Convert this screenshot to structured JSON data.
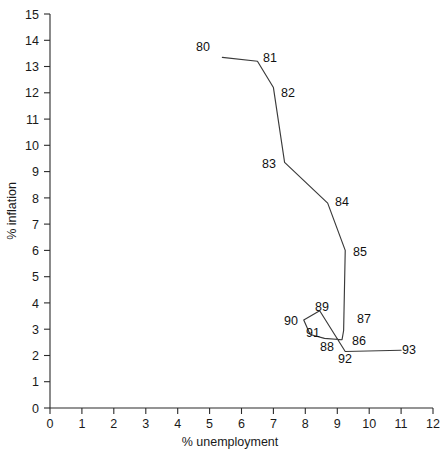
{
  "chart_data": {
    "type": "line",
    "title": "",
    "subtitle": "",
    "xlabel": "% unemployment",
    "ylabel": "% inflation",
    "xlim": [
      0,
      12
    ],
    "ylim": [
      0,
      15
    ],
    "xticks": [
      0,
      1,
      2,
      3,
      4,
      5,
      6,
      7,
      8,
      9,
      10,
      11,
      12
    ],
    "yticks": [
      0,
      1,
      2,
      3,
      4,
      5,
      6,
      7,
      8,
      9,
      10,
      11,
      12,
      13,
      14,
      15
    ],
    "grid": false,
    "legend": null,
    "legend_position": "none",
    "series": [
      {
        "name": "Phillips curve path",
        "point_labels": [
          "80",
          "81",
          "82",
          "83",
          "84",
          "85",
          "87",
          "86",
          "88",
          "91",
          "90",
          "89",
          "92",
          "93"
        ],
        "x": [
          5.4,
          6.5,
          7.0,
          7.35,
          8.7,
          9.25,
          9.2,
          9.15,
          8.6,
          8.15,
          7.95,
          8.45,
          9.25,
          11.0
        ],
        "y": [
          13.35,
          13.2,
          12.2,
          9.35,
          7.8,
          6.0,
          2.95,
          2.6,
          2.65,
          2.8,
          3.35,
          3.7,
          2.15,
          2.2
        ]
      }
    ],
    "annotations": [
      {
        "label": "80",
        "x": 5.4,
        "y": 13.35,
        "placement": "left"
      },
      {
        "label": "81",
        "x": 6.5,
        "y": 13.2,
        "placement": "right"
      },
      {
        "label": "82",
        "x": 7.0,
        "y": 12.2,
        "placement": "right"
      },
      {
        "label": "83",
        "x": 7.35,
        "y": 9.35,
        "placement": "left"
      },
      {
        "label": "84",
        "x": 8.7,
        "y": 7.8,
        "placement": "right"
      },
      {
        "label": "85",
        "x": 9.25,
        "y": 6.0,
        "placement": "right"
      },
      {
        "label": "89",
        "x": 8.45,
        "y": 3.7,
        "placement": "above"
      },
      {
        "label": "90",
        "x": 7.95,
        "y": 3.35,
        "placement": "left"
      },
      {
        "label": "91",
        "x": 8.15,
        "y": 2.8,
        "placement": "below-left"
      },
      {
        "label": "87",
        "x": 9.2,
        "y": 2.95,
        "placement": "right"
      },
      {
        "label": "86",
        "x": 9.15,
        "y": 2.6,
        "placement": "right"
      },
      {
        "label": "88",
        "x": 8.6,
        "y": 2.65,
        "placement": "below"
      },
      {
        "label": "92",
        "x": 9.25,
        "y": 2.15,
        "placement": "below"
      },
      {
        "label": "93",
        "x": 11.0,
        "y": 2.2,
        "placement": "right"
      }
    ]
  },
  "axes": {
    "x_tick_labels": [
      "0",
      "1",
      "2",
      "3",
      "4",
      "5",
      "6",
      "7",
      "8",
      "9",
      "10",
      "11",
      "12"
    ],
    "y_tick_labels": [
      "0",
      "1",
      "2",
      "3",
      "4",
      "5",
      "6",
      "7",
      "8",
      "9",
      "10",
      "11",
      "12",
      "13",
      "14",
      "15"
    ],
    "x_axis_title": "% unemployment",
    "y_axis_title": "% inflation"
  },
  "point_labels": {
    "p80": "80",
    "p81": "81",
    "p82": "82",
    "p83": "83",
    "p84": "84",
    "p85": "85",
    "p86": "86",
    "p87": "87",
    "p88": "88",
    "p89": "89",
    "p90": "90",
    "p91": "91",
    "p92": "92",
    "p93": "93"
  },
  "colors": {
    "line": "#3a3a3a",
    "axis": "#2b2b2b",
    "text": "#111111",
    "background": "#ffffff"
  }
}
